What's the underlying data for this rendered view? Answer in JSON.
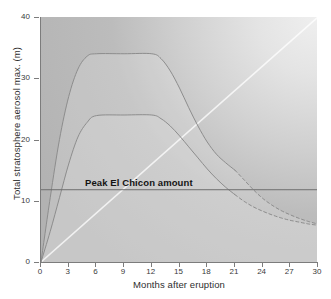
{
  "chart_data": {
    "type": "line",
    "title": "",
    "xlabel": "Months after eruption",
    "ylabel": "Total stratosphere aerosol max. (m)",
    "xlim": [
      0,
      30
    ],
    "ylim": [
      0,
      40
    ],
    "xticks": [
      0,
      3,
      6,
      9,
      12,
      15,
      18,
      21,
      24,
      27,
      30
    ],
    "yticks": [
      0,
      10,
      20,
      30,
      40
    ],
    "grid": false,
    "legend": "none",
    "annotations": [
      {
        "name": "peak-el-chicon-line",
        "text": "Peak El Chicon amount",
        "y": 11.8,
        "style": "horizontal reference line with bold label above"
      }
    ],
    "series": [
      {
        "name": "upper-estimate",
        "solid_until_x": 21,
        "x": [
          0,
          1,
          2,
          3,
          4,
          5,
          6,
          9,
          12,
          13,
          14,
          15,
          16,
          17,
          18,
          19,
          20,
          21,
          22,
          23,
          24,
          25,
          26,
          27,
          28,
          29,
          30
        ],
        "values": [
          0,
          10.5,
          20.0,
          27.0,
          31.5,
          33.6,
          34.0,
          34.0,
          34.0,
          33.2,
          31.2,
          28.4,
          25.2,
          22.2,
          19.6,
          17.6,
          16.2,
          15.0,
          13.4,
          11.8,
          10.4,
          9.3,
          8.4,
          7.7,
          7.1,
          6.6,
          6.2
        ]
      },
      {
        "name": "lower-estimate",
        "solid_until_x": 21,
        "x": [
          0,
          1,
          2,
          3,
          4,
          5,
          6,
          9,
          12,
          13,
          14,
          15,
          16,
          17,
          18,
          19,
          20,
          21,
          22,
          23,
          24,
          25,
          26,
          27,
          28,
          29,
          30
        ],
        "values": [
          0,
          5.0,
          10.5,
          16.0,
          20.4,
          22.8,
          23.9,
          24.0,
          24.0,
          23.4,
          22.2,
          20.6,
          18.8,
          17.0,
          15.2,
          13.6,
          12.2,
          11.0,
          9.9,
          9.0,
          8.3,
          7.7,
          7.2,
          6.8,
          6.5,
          6.2,
          6.0
        ]
      },
      {
        "name": "linear-baseline",
        "style": "light straight ray from origin",
        "x": [
          0,
          30
        ],
        "values": [
          0,
          40
        ]
      }
    ]
  },
  "axes": {
    "x_tick_labels": [
      "0",
      "3",
      "6",
      "9",
      "12",
      "15",
      "18",
      "21",
      "24",
      "27",
      "30"
    ],
    "y_tick_labels": [
      "0",
      "10",
      "20",
      "30",
      "40"
    ],
    "x_title": "Months after eruption",
    "y_title": "Total stratosphere aerosol max. (m)"
  },
  "annotation": {
    "peak_label": "Peak El Chicon amount"
  },
  "colors": {
    "curve": "#8d8d8d",
    "reference_line": "#6f6f6f",
    "axis": "#7c7c7c",
    "text": "#2e2e2e",
    "annotation_text": "#141414",
    "plot_background_light": "#efefef",
    "plot_background_dark": "#b2b2b2"
  }
}
